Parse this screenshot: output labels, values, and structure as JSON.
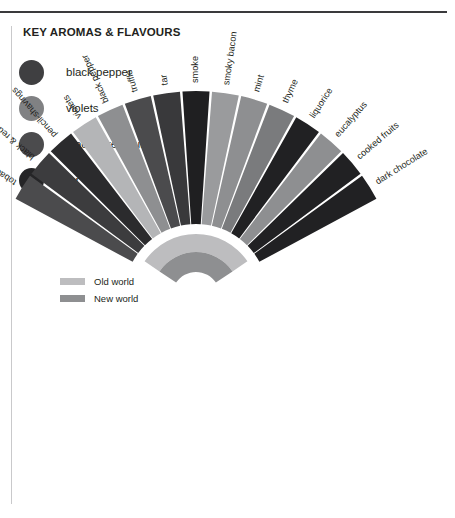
{
  "panel": {
    "title": "KEY AROMAS & FLAVOURS"
  },
  "aroma_legend": {
    "items": [
      {
        "label": "black pepper",
        "color": "#3f3f41"
      },
      {
        "label": "violets",
        "color": "#808183"
      },
      {
        "label": "black & red fruits",
        "color": "#4b4b4d"
      },
      {
        "label": "tar",
        "color": "#252527"
      }
    ]
  },
  "world_legend": {
    "items": [
      {
        "label": "Old world",
        "color": "#bdbdbf"
      },
      {
        "label": "New world",
        "color": "#8e8f91"
      }
    ]
  },
  "chart_data": {
    "type": "pie",
    "title": "KEY AROMAS & FLAVOURS",
    "subtype": "radial-fan / sunburst segment",
    "legend_position": "left",
    "grid": false,
    "center": {
      "x": 196,
      "y": 296
    },
    "inner_arc": {
      "note": "Old world / New world annulus at fan centre",
      "radius_inner": 24,
      "radius_outer": 62,
      "bands": [
        {
          "name": "Old world",
          "color": "#bdbdbf",
          "radius_inner": 44,
          "radius_outer": 62
        },
        {
          "name": "New world",
          "color": "#8e8f91",
          "radius_inner": 24,
          "radius_outer": 44
        }
      ]
    },
    "wedges_radius_inner": 72,
    "wedges_radius_outer": 205,
    "angle_start_deg": -62,
    "angle_end_deg": 62,
    "categories": [
      "tobacco",
      "black & red fruits",
      "pencil-shavings",
      "violets",
      "black pepper",
      "truffle",
      "tar",
      "smoke",
      "smoky bacon",
      "mint",
      "thyme",
      "liquorice",
      "eucalyptus",
      "cooked fruits",
      "dark chocolate"
    ],
    "values": [
      9.5,
      8.0,
      7.2,
      6.5,
      10.5,
      9.0,
      5.0,
      8.5,
      6.0,
      7.5,
      5.5,
      7.0,
      6.2,
      5.0,
      11.0
    ],
    "colors": [
      "#4b4b4d",
      "#3c3c3e",
      "#2b2b2d",
      "#b4b5b7",
      "#8e8f91",
      "#4b4b4d",
      "#39393b",
      "#1f1f21",
      "#9a9b9d",
      "#8e8f91",
      "#7a7b7d",
      "#212123",
      "#8e8f91",
      "#212123",
      "#212123"
    ],
    "xlabel": "",
    "ylabel": ""
  }
}
